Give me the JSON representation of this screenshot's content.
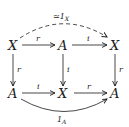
{
  "diagram": {
    "type": "commutative-diagram",
    "nodes": [
      {
        "id": "top-left",
        "label": "X"
      },
      {
        "id": "top-middle",
        "label": "A"
      },
      {
        "id": "top-right",
        "label": "X"
      },
      {
        "id": "bottom-left",
        "label": "A"
      },
      {
        "id": "bottom-middle",
        "label": "X"
      },
      {
        "id": "bottom-right",
        "label": "A"
      }
    ],
    "arrows": [
      {
        "from": "top-left",
        "to": "top-middle",
        "label": "r",
        "style": "solid"
      },
      {
        "from": "top-middle",
        "to": "top-right",
        "label": "i",
        "style": "solid"
      },
      {
        "from": "top-left",
        "to": "top-right",
        "label": "≃1",
        "label_sub": "X",
        "style": "dashed-curved"
      },
      {
        "from": "top-left",
        "to": "bottom-left",
        "label": "r",
        "style": "solid"
      },
      {
        "from": "top-middle",
        "to": "bottom-middle",
        "label": "i",
        "style": "solid"
      },
      {
        "from": "top-right",
        "to": "bottom-right",
        "label": "r",
        "style": "solid"
      },
      {
        "from": "bottom-left",
        "to": "bottom-middle",
        "label": "i",
        "style": "solid"
      },
      {
        "from": "bottom-middle",
        "to": "bottom-right",
        "label": "r",
        "style": "solid"
      },
      {
        "from": "bottom-left",
        "to": "bottom-right",
        "label": "1",
        "label_sub": "A",
        "style": "solid-curved"
      }
    ]
  }
}
